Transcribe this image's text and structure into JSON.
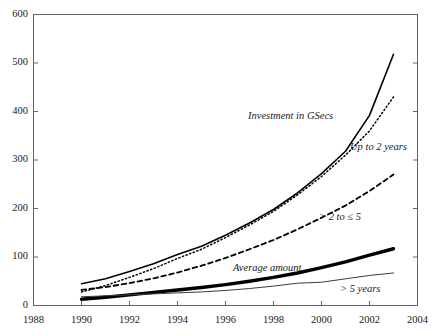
{
  "chart_data": {
    "type": "line",
    "title": "",
    "subtitle": "",
    "xlabel": "",
    "ylabel": "",
    "xlim": [
      1988,
      2004
    ],
    "ylim": [
      0,
      600
    ],
    "grid": false,
    "legend_position": "inline-annotations",
    "x_ticks": [
      1988,
      1990,
      1992,
      1994,
      1996,
      1998,
      2000,
      2002,
      2004
    ],
    "y_ticks": [
      0,
      100,
      200,
      300,
      400,
      500,
      600
    ],
    "x": [
      1990,
      1991,
      1992,
      1993,
      1994,
      1995,
      1996,
      1997,
      1998,
      1999,
      2000,
      2001,
      2002,
      2003
    ],
    "series": [
      {
        "name": "Investment in GSecs",
        "style": "solid",
        "width": 1.6,
        "color": "#000000",
        "values": [
          45,
          55,
          70,
          86,
          105,
          122,
          145,
          170,
          198,
          232,
          272,
          318,
          392,
          518
        ]
      },
      {
        "name": "Up to 2 years",
        "style": "dotted",
        "width": 1.5,
        "color": "#000000",
        "values": [
          28,
          41,
          58,
          76,
          97,
          116,
          140,
          166,
          194,
          228,
          266,
          310,
          360,
          430
        ]
      },
      {
        "name": "> 2 to ≤ 5",
        "style": "dashed",
        "width": 1.8,
        "color": "#000000",
        "values": [
          32,
          38,
          46,
          56,
          68,
          82,
          98,
          116,
          135,
          157,
          181,
          206,
          236,
          270
        ]
      },
      {
        "name": "Average amount",
        "style": "solid",
        "width": 3.4,
        "color": "#000000",
        "values": [
          13,
          17,
          22,
          27,
          32,
          37,
          43,
          50,
          58,
          67,
          78,
          90,
          104,
          117
        ]
      },
      {
        "name": "> 5 years",
        "style": "solid",
        "width": 1.0,
        "color": "#3a3a3a",
        "values": [
          18,
          20,
          22,
          24,
          26,
          28,
          31,
          35,
          40,
          46,
          48,
          55,
          62,
          67
        ]
      }
    ],
    "annotations": [
      {
        "text": "Investment in GSecs",
        "x_px": 248,
        "y_px": 110
      },
      {
        "text": "Up to 2 years",
        "x_px": 350,
        "y_px": 141
      },
      {
        "text": "> 2 to ≤ 5",
        "x_px": 319,
        "y_px": 211
      },
      {
        "text": "Average amount",
        "x_px": 233,
        "y_px": 262
      },
      {
        "text": "> 5 years",
        "x_px": 340,
        "y_px": 283
      }
    ]
  },
  "axis": {
    "y_labels": [
      "600",
      "500",
      "400",
      "300",
      "200",
      "100",
      "0"
    ],
    "x_labels": [
      "1988",
      "1990",
      "1992",
      "1994",
      "1996",
      "1998",
      "2000",
      "2002",
      "2004"
    ]
  }
}
